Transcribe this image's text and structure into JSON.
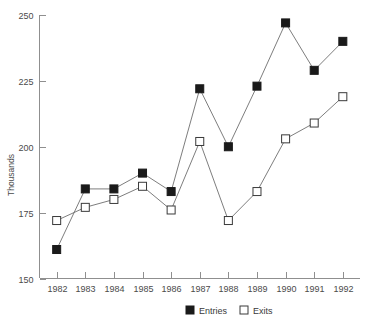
{
  "clipped_header_text": "",
  "chart_data": {
    "type": "line",
    "title": "",
    "xlabel": "",
    "ylabel": "Thousands",
    "x": [
      1982,
      1983,
      1984,
      1985,
      1986,
      1987,
      1988,
      1989,
      1990,
      1991,
      1992
    ],
    "categories": [
      "1982",
      "1983",
      "1984",
      "1985",
      "1986",
      "1987",
      "1988",
      "1989",
      "1990",
      "1991",
      "1992"
    ],
    "series": [
      {
        "name": "Entries",
        "marker": "filled-square",
        "color": "#1a1a1a",
        "values": [
          161,
          184,
          184,
          190,
          183,
          222,
          200,
          223,
          247,
          229,
          240
        ]
      },
      {
        "name": "Exits",
        "marker": "open-square",
        "color": "#ffffff",
        "values": [
          172,
          177,
          180,
          185,
          176,
          202,
          172,
          183,
          203,
          209,
          219
        ]
      }
    ],
    "ylim": [
      150,
      250
    ],
    "yticks": [
      150,
      175,
      200,
      225,
      250
    ],
    "ytick_labels": [
      "150",
      "175",
      "200",
      "225",
      "250"
    ],
    "xlim": [
      1981.4,
      1992.6
    ],
    "grid": false,
    "legend_position": "bottom-center",
    "legend": [
      "Entries",
      "Exits"
    ]
  },
  "axis": {
    "y_title": "Thousands"
  },
  "legend": {
    "entries_label": "Entries",
    "exits_label": "Exits"
  }
}
